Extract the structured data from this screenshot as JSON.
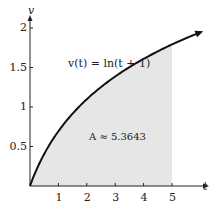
{
  "chart_data": {
    "type": "area",
    "title": "",
    "function_label": "v(t) = ln(t + 1)",
    "annotation": "A ≈ 5.3643",
    "xlabel": "t",
    "ylabel": "v",
    "xlim": [
      0,
      6
    ],
    "ylim": [
      0,
      2.1
    ],
    "x_ticks": [
      1,
      2,
      3,
      4,
      5
    ],
    "y_ticks": [
      0.5,
      1,
      1.5,
      2
    ],
    "x_tick_labels": [
      "1",
      "2",
      "3",
      "4",
      "5"
    ],
    "y_tick_labels": [
      "0.5",
      "1",
      "1.5",
      "2"
    ],
    "shaded_interval": [
      0,
      5
    ],
    "series": [
      {
        "name": "v(t) = ln(t+1)",
        "x": [
          0,
          0.5,
          1,
          1.5,
          2,
          2.5,
          3,
          3.5,
          4,
          4.5,
          5,
          5.5,
          5.9
        ],
        "y": [
          0,
          0.405,
          0.693,
          0.916,
          1.099,
          1.253,
          1.386,
          1.504,
          1.609,
          1.705,
          1.792,
          1.872,
          1.932
        ]
      }
    ],
    "grid": false,
    "colors": {
      "curve": "#111111",
      "fill": "#e6e6e6",
      "axis": "#222222"
    }
  }
}
